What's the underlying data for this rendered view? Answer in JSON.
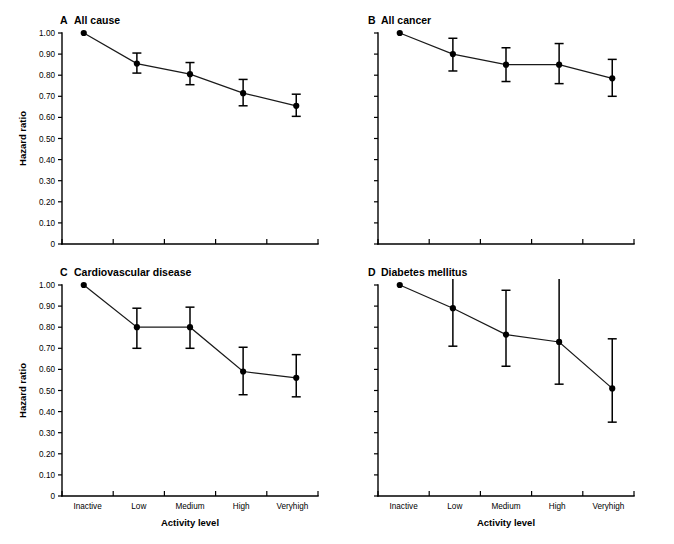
{
  "figure": {
    "y_axis_label": "Hazard ratio",
    "x_axis_label": "Activity level",
    "y_ticks": [
      "1.00",
      "0.90",
      "0.80",
      "0.70",
      "0.60",
      "0.50",
      "0.40",
      "0.30",
      "0.20",
      "0.10",
      "0"
    ],
    "categories": [
      "Inactive",
      "Low",
      "Medium",
      "High",
      "Veryhigh"
    ]
  },
  "chart_data": [
    {
      "type": "line",
      "panel": "A",
      "title": "All cause",
      "xlabel": "Activity level",
      "ylabel": "Hazard ratio",
      "ylim": [
        0,
        1.0
      ],
      "grid": false,
      "legend": "none",
      "categories": [
        "Inactive",
        "Low",
        "Medium",
        "High",
        "Veryhigh"
      ],
      "values": [
        1.0,
        0.855,
        0.805,
        0.715,
        0.655
      ],
      "ci_lower": [
        1.0,
        0.81,
        0.755,
        0.655,
        0.605
      ],
      "ci_upper": [
        1.0,
        0.905,
        0.86,
        0.78,
        0.71
      ]
    },
    {
      "type": "line",
      "panel": "B",
      "title": "All cancer",
      "xlabel": "Activity level",
      "ylabel": "Hazard ratio",
      "ylim": [
        0,
        1.0
      ],
      "grid": false,
      "legend": "none",
      "categories": [
        "Inactive",
        "Low",
        "Medium",
        "High",
        "Veryhigh"
      ],
      "values": [
        1.0,
        0.9,
        0.85,
        0.85,
        0.785
      ],
      "ci_lower": [
        1.0,
        0.82,
        0.77,
        0.76,
        0.7
      ],
      "ci_upper": [
        1.0,
        0.975,
        0.93,
        0.95,
        0.875
      ]
    },
    {
      "type": "line",
      "panel": "C",
      "title": "Cardiovascular disease",
      "xlabel": "Activity level",
      "ylabel": "Hazard ratio",
      "ylim": [
        0,
        1.0
      ],
      "grid": false,
      "legend": "none",
      "categories": [
        "Inactive",
        "Low",
        "Medium",
        "High",
        "Veryhigh"
      ],
      "values": [
        1.0,
        0.8,
        0.8,
        0.59,
        0.56
      ],
      "ci_lower": [
        1.0,
        0.7,
        0.7,
        0.48,
        0.47
      ],
      "ci_upper": [
        1.0,
        0.89,
        0.895,
        0.705,
        0.67
      ]
    },
    {
      "type": "line",
      "panel": "D",
      "title": "Diabetes mellitus",
      "xlabel": "Activity level",
      "ylabel": "Hazard ratio",
      "ylim": [
        0,
        1.0
      ],
      "grid": false,
      "legend": "none",
      "categories": [
        "Inactive",
        "Low",
        "Medium",
        "High",
        "Veryhigh"
      ],
      "values": [
        1.0,
        0.89,
        0.765,
        0.73,
        0.51
      ],
      "ci_lower": [
        1.0,
        0.71,
        0.615,
        0.53,
        0.35
      ],
      "ci_upper": [
        1.0,
        1.01,
        0.975,
        1.02,
        0.745
      ]
    }
  ]
}
